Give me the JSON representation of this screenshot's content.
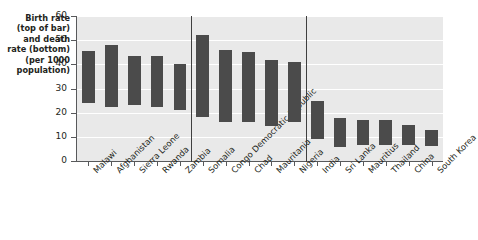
{
  "chart_data": {
    "type": "bar",
    "variant": "floating-range-bar",
    "title": "",
    "xlabel": "",
    "ylabel": "Birth rate (top of bar) and death rate (bottom) (per 1000 population)",
    "ylim": [
      0,
      60
    ],
    "yticks": [
      0,
      10,
      20,
      30,
      40,
      50,
      60
    ],
    "grid": true,
    "legend": "none",
    "value_meaning": {
      "top": "birth rate per 1000 population",
      "bottom": "death rate per 1000 population"
    },
    "group_separators": [
      5,
      10
    ],
    "categories": [
      "Malawi",
      "Afghanistan",
      "Sierra Leone",
      "Rwanda",
      "Zambia",
      "Somalia",
      "Congo Democratic Republic",
      "Chad",
      "Mauritania",
      "Nigeria",
      "India",
      "Sri Lanka",
      "Mauritius",
      "Thailand",
      "China",
      "South Korea"
    ],
    "birth_rate": [
      45.5,
      48,
      43.5,
      43.5,
      40,
      52,
      46,
      45,
      42,
      41,
      25,
      18,
      17,
      17,
      15,
      13
    ],
    "death_rate": [
      24,
      22.5,
      23,
      22.5,
      21,
      18,
      16,
      16,
      14.5,
      16,
      9,
      6,
      6.5,
      6.5,
      6.5,
      6
    ]
  },
  "axis_caption": "Birth rate\n(top of bar)\nand death\nrate (bottom)\n(per 1000\npopulation)",
  "colors": {
    "bar": "#4b4b4b",
    "plot_background": "#e9e9e9",
    "gridline": "#ffffff",
    "axis": "#58595b",
    "separator": "#3f3f3f",
    "text": "#231f20"
  }
}
